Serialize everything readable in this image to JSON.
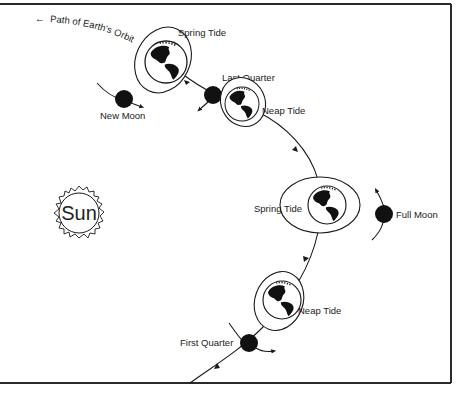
{
  "diagram": {
    "title_arrow_label": "← Path of Earth's Orbit",
    "orbit_label": "Path of Earth's Orbit",
    "sun_label": "Sun",
    "earth_positions": [
      {
        "id": "spring-tide-top",
        "label": "Spring Tide"
      },
      {
        "id": "neap-tide-upper",
        "label": "Neap Tide"
      },
      {
        "id": "spring-tide-middle",
        "label": "Spring Tide"
      },
      {
        "id": "neap-tide-lower",
        "label": "Neap Tide"
      }
    ],
    "moon_phases": [
      {
        "id": "new-moon",
        "label": "New Moon"
      },
      {
        "id": "last-quarter",
        "label": "Last Quarter"
      },
      {
        "id": "full-moon",
        "label": "Full Moon"
      },
      {
        "id": "first-quarter",
        "label": "First Quarter"
      }
    ],
    "colors": {
      "ink": "#1a1a1a",
      "background": "#ffffff"
    }
  }
}
